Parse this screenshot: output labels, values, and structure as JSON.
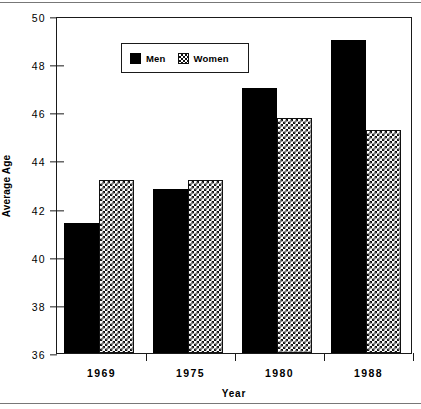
{
  "chart_data": {
    "type": "bar",
    "title": "",
    "xlabel": "Year",
    "ylabel": "Average Age",
    "categories": [
      "1969",
      "1975",
      "1980",
      "1988"
    ],
    "series": [
      {
        "name": "Men",
        "values": [
          41.4,
          42.8,
          47.0,
          49.0
        ],
        "style": "solid-black"
      },
      {
        "name": "Women",
        "values": [
          43.2,
          43.2,
          45.75,
          45.25
        ],
        "style": "checkered"
      }
    ],
    "ylim": [
      36,
      50
    ],
    "yticks": [
      "36",
      "38",
      "40",
      "42",
      "44",
      "46",
      "48",
      "50"
    ],
    "ytick_values": [
      36,
      38,
      40,
      42,
      44,
      46,
      48,
      50
    ],
    "grid": false,
    "legend_position": "top-left",
    "colors": {
      "men": "#000000",
      "women_pattern": "#111111",
      "axis": "#1a1a1a",
      "background": "#ffffff"
    }
  },
  "legend": {
    "entries": [
      {
        "label": "Men"
      },
      {
        "label": "Women"
      }
    ]
  }
}
